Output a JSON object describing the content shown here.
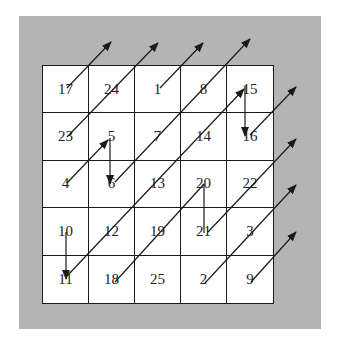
{
  "diagram": {
    "title": "",
    "type": "magic-square-siamese-method",
    "size": 5,
    "colors": {
      "frame": "#b4b4b4",
      "cell_background": "#ffffff",
      "lines": "#1a1a1a"
    },
    "grid": [
      [
        "17",
        "24",
        "1",
        "8",
        "15"
      ],
      [
        "23",
        "5",
        "7",
        "14",
        "16"
      ],
      [
        "4",
        "6",
        "13",
        "20",
        "22"
      ],
      [
        "10",
        "12",
        "19",
        "21",
        "3"
      ],
      [
        "11",
        "18",
        "25",
        "2",
        "9"
      ]
    ],
    "arrows": [
      {
        "from": "17",
        "to": "out-top",
        "x1": 67,
        "y1": 88,
        "x2": 111,
        "y2": 42,
        "head": true
      },
      {
        "from": "23",
        "to": "out-top",
        "x1": 67,
        "y1": 137,
        "x2": 158,
        "y2": 43,
        "head": true
      },
      {
        "from": "1",
        "to": "out-top",
        "x1": 160,
        "y1": 88,
        "x2": 203,
        "y2": 43,
        "head": true
      },
      {
        "from": "6",
        "to": "out-top",
        "x1": 115,
        "y1": 182,
        "x2": 250,
        "y2": 39,
        "head": true
      },
      {
        "from": "11",
        "to": "15",
        "x1": 67,
        "y1": 276,
        "x2": 244,
        "y2": 89,
        "head": true
      },
      {
        "from": "15",
        "to": "16",
        "x1": 245,
        "y1": 86,
        "x2": 245,
        "y2": 136,
        "head": true
      },
      {
        "from": "16",
        "to": "out-right",
        "x1": 250,
        "y1": 135,
        "x2": 296,
        "y2": 87,
        "head": true
      },
      {
        "from": "4",
        "to": "5",
        "x1": 67,
        "y1": 183,
        "x2": 108,
        "y2": 140,
        "head": true
      },
      {
        "from": "5",
        "to": "6",
        "x1": 110,
        "y1": 138,
        "x2": 110,
        "y2": 184,
        "head": true
      },
      {
        "from": "18",
        "to": "20",
        "x1": 115,
        "y1": 282,
        "x2": 204,
        "y2": 184,
        "head": false
      },
      {
        "from": "20",
        "to": "21",
        "x1": 204,
        "y1": 184,
        "x2": 204,
        "y2": 233,
        "head": false
      },
      {
        "from": "21",
        "to": "out-right",
        "x1": 208,
        "y1": 232,
        "x2": 296,
        "y2": 139,
        "head": true
      },
      {
        "from": "10",
        "to": "11",
        "x1": 66,
        "y1": 232,
        "x2": 66,
        "y2": 279,
        "head": true
      },
      {
        "from": "2",
        "to": "out-right",
        "x1": 205,
        "y1": 283,
        "x2": 296,
        "y2": 185,
        "head": true
      },
      {
        "from": "9",
        "to": "out-right",
        "x1": 251,
        "y1": 282,
        "x2": 296,
        "y2": 232,
        "head": true
      }
    ]
  }
}
